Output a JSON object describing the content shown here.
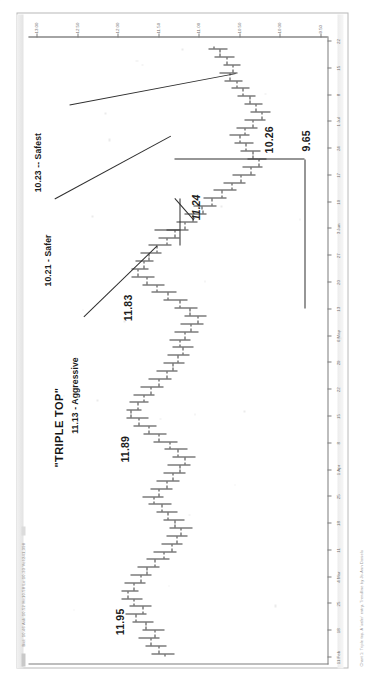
{
  "document": {
    "kind": "scanned-stock-chart-printout",
    "header_text": "Bid: 10.46  Ask:10.52   Hi:10.58  Lo:10.33  Vol:241,398",
    "footer_caption": "Chart 1: Triple top. A 'safer' entry. Trendline by Jo-Ann Daniels",
    "orientation": "landscape-rotated-90ccw"
  },
  "chart_data": {
    "type": "ohlc",
    "title": "\"TRIPLE TOP\"",
    "xlabel": "",
    "ylabel": "",
    "ylim": [
      9.4,
      13.1
    ],
    "grid": false,
    "legend": "none",
    "y_ticks": [
      13.0,
      12.5,
      12.0,
      11.5,
      11.0,
      10.5,
      10.0,
      9.5
    ],
    "y_tick_labels": [
      "13.00",
      "12.50",
      "12.00",
      "11.50",
      "11.00",
      "10.50",
      "10.00",
      "9.50"
    ],
    "x_tick_labels": [
      "11 Feb",
      "18",
      "25",
      "4 Mar",
      "11",
      "18",
      "25",
      "1 Apr",
      "8",
      "15",
      "22",
      "29",
      "6 May",
      "13",
      "20",
      "27",
      "3 Jun",
      "10",
      "17",
      "24",
      "1 Jul",
      "8",
      "15",
      "22"
    ],
    "annotations": [
      {
        "id": "triple-top-title",
        "text": "\"TRIPLE TOP\"",
        "style": "bold"
      },
      {
        "id": "peak-1",
        "text": "11.95",
        "style": "bold"
      },
      {
        "id": "peak-2",
        "text": "11.89",
        "style": "bold"
      },
      {
        "id": "peak-3",
        "text": "11.83",
        "style": "bold"
      },
      {
        "id": "neckline",
        "text": "11.24",
        "style": "bold-italic"
      },
      {
        "id": "measured-move",
        "text": "10.26",
        "style": "bold"
      },
      {
        "id": "low",
        "text": "9.65",
        "style": "bold"
      },
      {
        "id": "entry-aggressive",
        "text": "11.13 - Aggressive",
        "style": "leader"
      },
      {
        "id": "entry-safer",
        "text": "10.21 - Safer",
        "style": "leader"
      },
      {
        "id": "entry-safest",
        "text": "10.23 -- Safest",
        "style": "leader"
      }
    ],
    "bars": [
      {
        "x": 0,
        "o": 11.42,
        "h": 11.58,
        "l": 11.3,
        "c": 11.5
      },
      {
        "x": 1,
        "o": 11.5,
        "h": 11.66,
        "l": 11.4,
        "c": 11.6
      },
      {
        "x": 2,
        "o": 11.6,
        "h": 11.74,
        "l": 11.48,
        "c": 11.55
      },
      {
        "x": 3,
        "o": 11.55,
        "h": 11.7,
        "l": 11.42,
        "c": 11.66
      },
      {
        "x": 4,
        "o": 11.66,
        "h": 11.82,
        "l": 11.56,
        "c": 11.78
      },
      {
        "x": 5,
        "o": 11.78,
        "h": 11.9,
        "l": 11.64,
        "c": 11.7
      },
      {
        "x": 6,
        "o": 11.7,
        "h": 11.86,
        "l": 11.58,
        "c": 11.8
      },
      {
        "x": 7,
        "o": 11.8,
        "h": 11.95,
        "l": 11.7,
        "c": 11.88
      },
      {
        "x": 8,
        "o": 11.88,
        "h": 11.95,
        "l": 11.74,
        "c": 11.8
      },
      {
        "x": 9,
        "o": 11.8,
        "h": 11.92,
        "l": 11.66,
        "c": 11.72
      },
      {
        "x": 10,
        "o": 11.72,
        "h": 11.84,
        "l": 11.58,
        "c": 11.64
      },
      {
        "x": 11,
        "o": 11.64,
        "h": 11.76,
        "l": 11.48,
        "c": 11.54
      },
      {
        "x": 12,
        "o": 11.54,
        "h": 11.64,
        "l": 11.36,
        "c": 11.44
      },
      {
        "x": 13,
        "o": 11.44,
        "h": 11.56,
        "l": 11.28,
        "c": 11.34
      },
      {
        "x": 14,
        "o": 11.34,
        "h": 11.46,
        "l": 11.2,
        "c": 11.28
      },
      {
        "x": 15,
        "o": 11.28,
        "h": 11.4,
        "l": 11.14,
        "c": 11.22
      },
      {
        "x": 16,
        "o": 11.22,
        "h": 11.36,
        "l": 11.08,
        "c": 11.3
      },
      {
        "x": 17,
        "o": 11.3,
        "h": 11.44,
        "l": 11.18,
        "c": 11.38
      },
      {
        "x": 18,
        "o": 11.38,
        "h": 11.52,
        "l": 11.26,
        "c": 11.46
      },
      {
        "x": 19,
        "o": 11.46,
        "h": 11.62,
        "l": 11.34,
        "c": 11.56
      },
      {
        "x": 20,
        "o": 11.56,
        "h": 11.7,
        "l": 11.44,
        "c": 11.5
      },
      {
        "x": 21,
        "o": 11.5,
        "h": 11.6,
        "l": 11.32,
        "c": 11.4
      },
      {
        "x": 22,
        "o": 11.4,
        "h": 11.52,
        "l": 11.24,
        "c": 11.32
      },
      {
        "x": 23,
        "o": 11.32,
        "h": 11.44,
        "l": 11.16,
        "c": 11.24
      },
      {
        "x": 24,
        "o": 11.24,
        "h": 11.38,
        "l": 11.1,
        "c": 11.18
      },
      {
        "x": 25,
        "o": 11.18,
        "h": 11.32,
        "l": 11.04,
        "c": 11.26
      },
      {
        "x": 26,
        "o": 11.26,
        "h": 11.42,
        "l": 11.14,
        "c": 11.36
      },
      {
        "x": 27,
        "o": 11.36,
        "h": 11.56,
        "l": 11.26,
        "c": 11.5
      },
      {
        "x": 28,
        "o": 11.5,
        "h": 11.68,
        "l": 11.4,
        "c": 11.62
      },
      {
        "x": 29,
        "o": 11.62,
        "h": 11.8,
        "l": 11.52,
        "c": 11.74
      },
      {
        "x": 30,
        "o": 11.74,
        "h": 11.89,
        "l": 11.62,
        "c": 11.84
      },
      {
        "x": 31,
        "o": 11.84,
        "h": 11.89,
        "l": 11.7,
        "c": 11.76
      },
      {
        "x": 32,
        "o": 11.76,
        "h": 11.86,
        "l": 11.62,
        "c": 11.68
      },
      {
        "x": 33,
        "o": 11.68,
        "h": 11.8,
        "l": 11.54,
        "c": 11.6
      },
      {
        "x": 34,
        "o": 11.6,
        "h": 11.72,
        "l": 11.44,
        "c": 11.5
      },
      {
        "x": 35,
        "o": 11.5,
        "h": 11.62,
        "l": 11.34,
        "c": 11.4
      },
      {
        "x": 36,
        "o": 11.4,
        "h": 11.52,
        "l": 11.26,
        "c": 11.32
      },
      {
        "x": 37,
        "o": 11.32,
        "h": 11.44,
        "l": 11.18,
        "c": 11.26
      },
      {
        "x": 38,
        "o": 11.26,
        "h": 11.38,
        "l": 11.12,
        "c": 11.2
      },
      {
        "x": 39,
        "o": 11.2,
        "h": 11.32,
        "l": 11.06,
        "c": 11.24
      },
      {
        "x": 40,
        "o": 11.24,
        "h": 11.36,
        "l": 11.1,
        "c": 11.18
      },
      {
        "x": 41,
        "o": 11.18,
        "h": 11.3,
        "l": 11.0,
        "c": 11.1
      },
      {
        "x": 42,
        "o": 11.1,
        "h": 11.22,
        "l": 10.94,
        "c": 11.02
      },
      {
        "x": 43,
        "o": 11.02,
        "h": 11.18,
        "l": 10.9,
        "c": 11.12
      },
      {
        "x": 44,
        "o": 11.12,
        "h": 11.3,
        "l": 11.02,
        "c": 11.24
      },
      {
        "x": 45,
        "o": 11.24,
        "h": 11.44,
        "l": 11.14,
        "c": 11.38
      },
      {
        "x": 46,
        "o": 11.38,
        "h": 11.58,
        "l": 11.28,
        "c": 11.52
      },
      {
        "x": 47,
        "o": 11.52,
        "h": 11.7,
        "l": 11.42,
        "c": 11.64
      },
      {
        "x": 48,
        "o": 11.64,
        "h": 11.83,
        "l": 11.54,
        "c": 11.76
      },
      {
        "x": 49,
        "o": 11.76,
        "h": 11.83,
        "l": 11.62,
        "c": 11.68
      },
      {
        "x": 50,
        "o": 11.68,
        "h": 11.78,
        "l": 11.56,
        "c": 11.62
      },
      {
        "x": 51,
        "o": 11.62,
        "h": 11.72,
        "l": 11.46,
        "c": 11.52
      },
      {
        "x": 52,
        "o": 11.52,
        "h": 11.62,
        "l": 11.34,
        "c": 11.4
      },
      {
        "x": 53,
        "o": 11.4,
        "h": 11.5,
        "l": 11.24,
        "c": 11.3
      },
      {
        "x": 54,
        "o": 11.3,
        "h": 11.4,
        "l": 11.13,
        "c": 11.18
      },
      {
        "x": 55,
        "o": 11.18,
        "h": 11.28,
        "l": 11.02,
        "c": 11.08
      },
      {
        "x": 56,
        "o": 11.08,
        "h": 11.18,
        "l": 10.9,
        "c": 10.96
      },
      {
        "x": 57,
        "o": 10.96,
        "h": 11.06,
        "l": 10.78,
        "c": 10.84
      },
      {
        "x": 58,
        "o": 10.84,
        "h": 10.94,
        "l": 10.66,
        "c": 10.72
      },
      {
        "x": 59,
        "o": 10.72,
        "h": 10.82,
        "l": 10.54,
        "c": 10.6
      },
      {
        "x": 60,
        "o": 10.6,
        "h": 10.7,
        "l": 10.42,
        "c": 10.48
      },
      {
        "x": 61,
        "o": 10.48,
        "h": 10.58,
        "l": 10.3,
        "c": 10.36
      },
      {
        "x": 62,
        "o": 10.36,
        "h": 10.46,
        "l": 10.21,
        "c": 10.26
      },
      {
        "x": 63,
        "o": 10.26,
        "h": 10.4,
        "l": 10.16,
        "c": 10.34
      },
      {
        "x": 64,
        "o": 10.34,
        "h": 10.48,
        "l": 10.24,
        "c": 10.42
      },
      {
        "x": 65,
        "o": 10.42,
        "h": 10.56,
        "l": 10.32,
        "c": 10.5
      },
      {
        "x": 66,
        "o": 10.5,
        "h": 10.62,
        "l": 10.38,
        "c": 10.44
      },
      {
        "x": 67,
        "o": 10.44,
        "h": 10.54,
        "l": 10.28,
        "c": 10.34
      },
      {
        "x": 68,
        "o": 10.34,
        "h": 10.44,
        "l": 10.18,
        "c": 10.23
      },
      {
        "x": 69,
        "o": 10.23,
        "h": 10.36,
        "l": 10.12,
        "c": 10.3
      },
      {
        "x": 70,
        "o": 10.3,
        "h": 10.44,
        "l": 10.22,
        "c": 10.38
      },
      {
        "x": 71,
        "o": 10.38,
        "h": 10.52,
        "l": 10.3,
        "c": 10.46
      },
      {
        "x": 72,
        "o": 10.46,
        "h": 10.6,
        "l": 10.38,
        "c": 10.54
      },
      {
        "x": 73,
        "o": 10.54,
        "h": 10.68,
        "l": 10.46,
        "c": 10.62
      },
      {
        "x": 74,
        "o": 10.62,
        "h": 10.74,
        "l": 10.52,
        "c": 10.58
      },
      {
        "x": 75,
        "o": 10.58,
        "h": 10.7,
        "l": 10.48,
        "c": 10.66
      },
      {
        "x": 76,
        "o": 10.66,
        "h": 10.8,
        "l": 10.56,
        "c": 10.74
      },
      {
        "x": 77,
        "o": 10.74,
        "h": 10.88,
        "l": 10.64,
        "c": 10.82
      }
    ]
  }
}
